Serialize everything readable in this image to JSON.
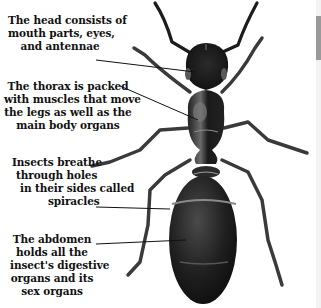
{
  "diagram": {
    "subject": "ant",
    "labels": {
      "head": [
        "The head consists of",
        "mouth parts, eyes,",
        "and antennae"
      ],
      "thorax": [
        "The thorax is packed",
        "with muscles that move",
        "the legs as well as the",
        "main body organs"
      ],
      "spiracles": [
        "Insects breathe",
        "through holes",
        "in their sides called",
        "spiracles"
      ],
      "abdomen": [
        "The abdomen",
        "holds all the",
        "insect's digestive",
        "organs and its",
        "sex organs"
      ]
    },
    "colors": {
      "background": "#ffffff",
      "text": "#111111",
      "insect_body": "#1e1e1e",
      "insect_highlight": "#6a6a6a",
      "leader_line": "#111111"
    }
  }
}
